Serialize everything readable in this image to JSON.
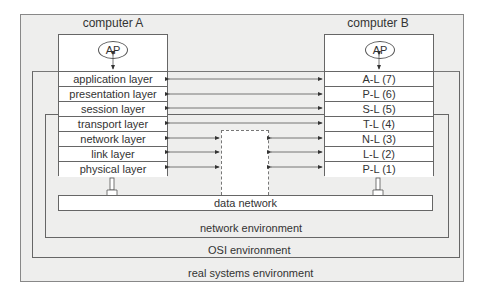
{
  "diagram": {
    "computer_a": {
      "title": "computer A",
      "ap_label": "AP",
      "layers": [
        "application layer",
        "presentation layer",
        "session layer",
        "transport layer",
        "network layer",
        "link layer",
        "physical layer"
      ]
    },
    "computer_b": {
      "title": "computer B",
      "ap_label": "AP",
      "layers": [
        "A-L (7)",
        "P-L (6)",
        "S-L (5)",
        "T-L (4)",
        "N-L (3)",
        "L-L (2)",
        "P-L (1)"
      ]
    },
    "data_network_label": "data network",
    "environments": {
      "network": "network environment",
      "osi": "OSI environment",
      "real": "real systems environment"
    },
    "colors": {
      "background": "#eeeeed",
      "box_fill": "#ffffff",
      "line": "#555555"
    }
  }
}
